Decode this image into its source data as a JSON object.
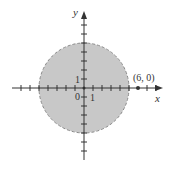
{
  "graph": {
    "x_axis_label": "x",
    "y_axis_label": "y",
    "origin_label": "0",
    "x_tick_label": "1",
    "y_tick_label": "1",
    "point_label": "(6, 0)",
    "point": {
      "x": 6,
      "y": 0
    },
    "circle": {
      "center": [
        0,
        0
      ],
      "radius": 5,
      "boundary": "dashed",
      "fill": "shaded"
    },
    "colors": {
      "fill": "#c8c8c8",
      "boundary": "#8a8a8a",
      "axis": "#333333"
    }
  }
}
